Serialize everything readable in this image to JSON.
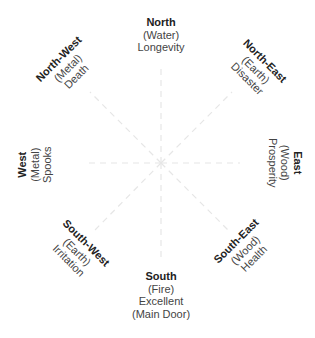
{
  "diagram": {
    "center": {
      "x": 161,
      "y": 163
    },
    "line_color": "#e6e6e6",
    "directions": [
      {
        "key": "north",
        "name": "North",
        "element": "(Water)",
        "meaning": "Longevity",
        "note": "",
        "x": 161,
        "y": 35,
        "rotate": 0,
        "line_end": [
          161,
          65
        ]
      },
      {
        "key": "north-west",
        "name": "North-West",
        "element": "(Metal)",
        "meaning": "Death",
        "note": "",
        "x": 67,
        "y": 68,
        "rotate": -45,
        "line_end": [
          90,
          92
        ]
      },
      {
        "key": "north-east",
        "name": "North-East",
        "element": "(Earth)",
        "meaning": "Disaster",
        "note": "",
        "x": 256,
        "y": 70,
        "rotate": 45,
        "line_end": [
          232,
          92
        ]
      },
      {
        "key": "west",
        "name": "West",
        "element": "(Metal)",
        "meaning": "Spooks",
        "note": "",
        "x": 34,
        "y": 165,
        "rotate": -90,
        "line_end": [
          85,
          163
        ]
      },
      {
        "key": "east",
        "name": "East",
        "element": "(Wood)",
        "meaning": "Prosperity",
        "note": "",
        "x": 285,
        "y": 163,
        "rotate": 90,
        "line_end": [
          240,
          163
        ]
      },
      {
        "key": "south-west",
        "name": "South-West",
        "element": "(Earth)",
        "meaning": "Irritation",
        "note": "",
        "x": 77,
        "y": 252,
        "rotate": 45,
        "line_end": [
          95,
          230
        ]
      },
      {
        "key": "south-east",
        "name": "South-East",
        "element": "(Wood)",
        "meaning": "Health",
        "note": "",
        "x": 245,
        "y": 250,
        "rotate": -45,
        "line_end": [
          228,
          230
        ]
      },
      {
        "key": "south",
        "name": "South",
        "element": "(Fire)",
        "meaning": "Excellent",
        "note": "(Main Door)",
        "x": 161,
        "y": 295,
        "rotate": 0,
        "line_end": [
          161,
          262
        ]
      }
    ]
  }
}
